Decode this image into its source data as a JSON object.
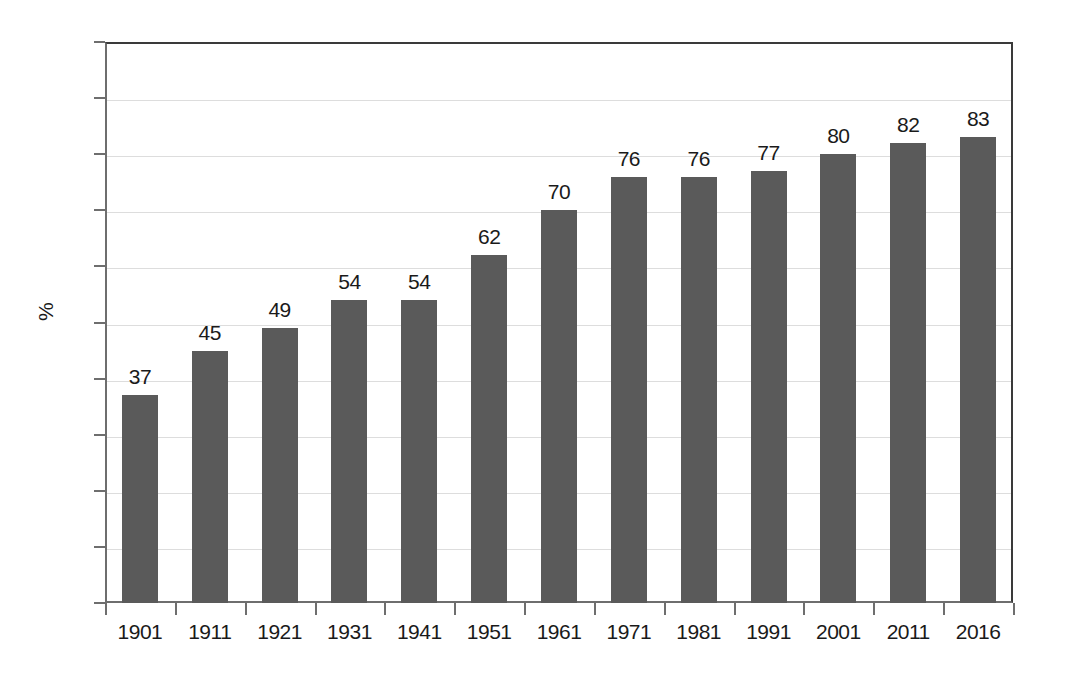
{
  "chart_data": {
    "type": "bar",
    "title": "",
    "subtitle": "",
    "xlabel": "",
    "ylabel": "%",
    "ylim": [
      0,
      100
    ],
    "ytick_step": 10,
    "yticks": [
      0,
      10,
      20,
      30,
      40,
      50,
      60,
      70,
      80,
      90,
      100
    ],
    "ytick_labels": [
      "0",
      "10",
      "20",
      "30",
      "40",
      "50",
      "60",
      "70",
      "80",
      "90",
      "100"
    ],
    "categories": [
      "1901",
      "1911",
      "1921",
      "1931",
      "1941",
      "1951",
      "1961",
      "1971",
      "1981",
      "1991",
      "2001",
      "2011",
      "2016"
    ],
    "values": [
      37,
      45,
      49,
      54,
      54,
      62,
      70,
      76,
      76,
      77,
      80,
      82,
      83
    ],
    "value_labels": [
      "37",
      "45",
      "49",
      "54",
      "54",
      "62",
      "70",
      "76",
      "76",
      "77",
      "80",
      "82",
      "83"
    ],
    "grid": true,
    "grid_axis": "y",
    "legend": false,
    "legend_position": "none",
    "annotations": [],
    "colors": {
      "bar": "#5a5a5a",
      "gridline": "#dddddd",
      "axis": "#6e6e6e",
      "frame": "#3a3a3a",
      "text": "#1a1a1a",
      "background": "#ffffff"
    }
  }
}
